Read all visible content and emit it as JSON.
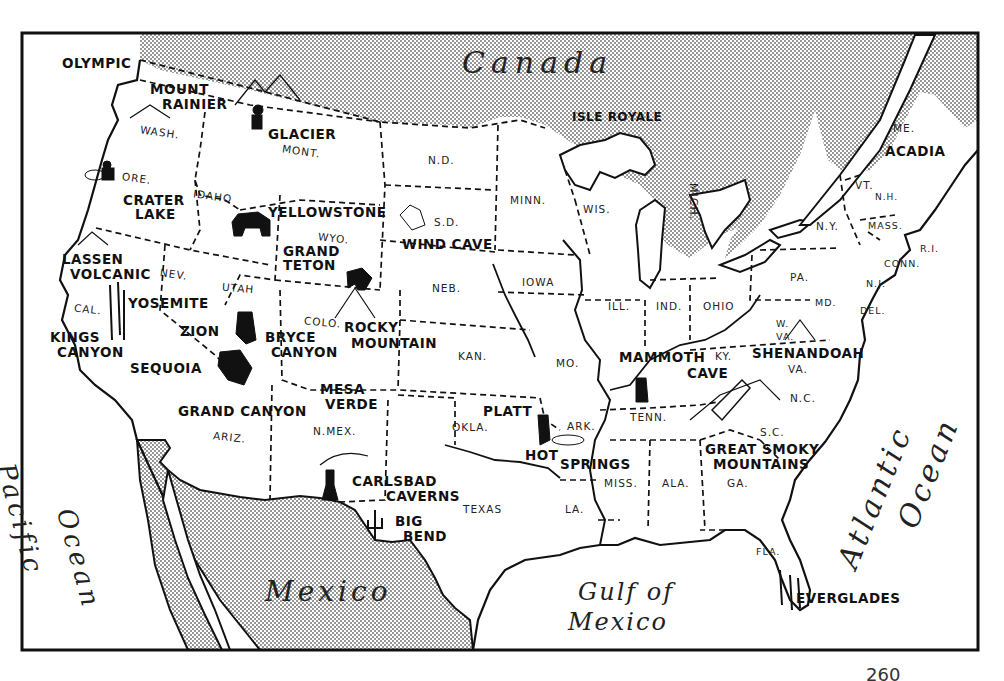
{
  "map": {
    "title": "National Parks of the United States",
    "page_number": "260",
    "colors": {
      "ink": "#111111",
      "paper": "#ffffff",
      "stipple": "#9a9a9a"
    },
    "countries": [
      {
        "id": "canada",
        "label": "Canada"
      },
      {
        "id": "mexico",
        "label": "Mexico"
      }
    ],
    "water_bodies": [
      {
        "id": "pacific",
        "line1": "Pacific",
        "line2": "Ocean"
      },
      {
        "id": "atlantic",
        "line1": "Atlantic",
        "line2": "Ocean"
      },
      {
        "id": "gulf",
        "line1": "Gulf of",
        "line2": "Mexico"
      }
    ],
    "states": [
      "WASH.",
      "ORE.",
      "IDAHO",
      "MONT.",
      "WYO.",
      "N.D.",
      "S.D.",
      "NEB.",
      "MINN.",
      "WIS.",
      "IOWA",
      "ILL.",
      "IND.",
      "OHIO",
      "PA.",
      "N.Y.",
      "VT.",
      "N.H.",
      "ME.",
      "MASS.",
      "R.I.",
      "CONN.",
      "N.J.",
      "DEL.",
      "MD.",
      "W. VA.",
      "VA.",
      "KY.",
      "TENN.",
      "N.C.",
      "S.C.",
      "GA.",
      "ALA.",
      "MISS.",
      "LA.",
      "ARK.",
      "MO.",
      "KAN.",
      "OKLA.",
      "TEXAS",
      "N.MEX.",
      "ARIZ.",
      "COLO.",
      "UTAH",
      "NEV.",
      "CAL.",
      "FLA.",
      "MICH."
    ],
    "parks": [
      {
        "id": "olympic",
        "lines": [
          "OLYMPIC"
        ]
      },
      {
        "id": "mount-rainier",
        "lines": [
          "MOUNT",
          "RAINIER"
        ]
      },
      {
        "id": "glacier",
        "lines": [
          "GLACIER"
        ]
      },
      {
        "id": "crater-lake",
        "lines": [
          "CRATER",
          "LAKE"
        ]
      },
      {
        "id": "yellowstone",
        "lines": [
          "YELLOWSTONE"
        ]
      },
      {
        "id": "grand-teton",
        "lines": [
          "GRAND",
          "TETON"
        ]
      },
      {
        "id": "wind-cave",
        "lines": [
          "WIND CAVE"
        ]
      },
      {
        "id": "isle-royale",
        "lines": [
          "ISLE ROYALE"
        ]
      },
      {
        "id": "acadia",
        "lines": [
          "ACADIA"
        ]
      },
      {
        "id": "lassen-volcanic",
        "lines": [
          "LASSEN",
          "VOLCANIC"
        ]
      },
      {
        "id": "yosemite",
        "lines": [
          "YOSEMITE"
        ]
      },
      {
        "id": "kings-canyon",
        "lines": [
          "KINGS",
          "CANYON"
        ]
      },
      {
        "id": "sequoia",
        "lines": [
          "SEQUOIA"
        ]
      },
      {
        "id": "zion",
        "lines": [
          "ZION"
        ]
      },
      {
        "id": "bryce-canyon",
        "lines": [
          "BRYCE",
          "CANYON"
        ]
      },
      {
        "id": "grand-canyon",
        "lines": [
          "GRAND CANYON"
        ]
      },
      {
        "id": "rocky-mountain",
        "lines": [
          "ROCKY",
          "MOUNTAIN"
        ]
      },
      {
        "id": "mesa-verde",
        "lines": [
          "MESA",
          "VERDE"
        ]
      },
      {
        "id": "carlsbad-caverns",
        "lines": [
          "CARLSBAD",
          "CAVERNS"
        ]
      },
      {
        "id": "big-bend",
        "lines": [
          "BIG",
          "BEND"
        ]
      },
      {
        "id": "platt",
        "lines": [
          "PLATT"
        ]
      },
      {
        "id": "hot-springs",
        "lines": [
          "HOT",
          "SPRINGS"
        ]
      },
      {
        "id": "mammoth-cave",
        "lines": [
          "MAMMOTH",
          "CAVE"
        ]
      },
      {
        "id": "shenandoah",
        "lines": [
          "SHENANDOAH"
        ]
      },
      {
        "id": "great-smoky-mountains",
        "lines": [
          "GREAT SMOKY",
          "MOUNTAINS"
        ]
      },
      {
        "id": "everglades",
        "lines": [
          "EVERGLADES"
        ]
      }
    ]
  }
}
